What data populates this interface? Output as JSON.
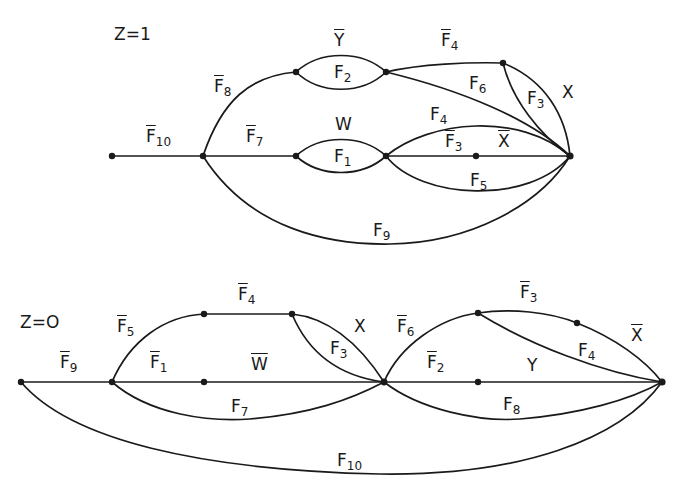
{
  "diagrams": [
    {
      "title": "Z=1",
      "labels": [
        {
          "id": "f10",
          "base": "F",
          "sub": "10",
          "bar": true,
          "x": 146,
          "y": 128
        },
        {
          "id": "f8",
          "base": "F",
          "sub": "8",
          "bar": true,
          "x": 214,
          "y": 78
        },
        {
          "id": "f7",
          "base": "F",
          "sub": "7",
          "bar": true,
          "x": 246,
          "y": 128
        },
        {
          "id": "ybar",
          "base": "Y",
          "sub": "",
          "bar": true,
          "x": 334,
          "y": 32
        },
        {
          "id": "f2",
          "base": "F",
          "sub": "2",
          "bar": false,
          "x": 334,
          "y": 64
        },
        {
          "id": "w",
          "base": "W",
          "sub": "",
          "bar": false,
          "x": 335,
          "y": 116
        },
        {
          "id": "f1",
          "base": "F",
          "sub": "1",
          "bar": false,
          "x": 334,
          "y": 148
        },
        {
          "id": "f4bar",
          "base": "F",
          "sub": "4",
          "bar": true,
          "x": 441,
          "y": 32
        },
        {
          "id": "f6",
          "base": "F",
          "sub": "6",
          "bar": false,
          "x": 469,
          "y": 75
        },
        {
          "id": "f3",
          "base": "F",
          "sub": "3",
          "bar": false,
          "x": 527,
          "y": 90
        },
        {
          "id": "x",
          "base": "X",
          "sub": "",
          "bar": false,
          "x": 562,
          "y": 84
        },
        {
          "id": "f4",
          "base": "F",
          "sub": "4",
          "bar": false,
          "x": 430,
          "y": 106
        },
        {
          "id": "f3bar",
          "base": "F",
          "sub": "3",
          "bar": true,
          "x": 445,
          "y": 133
        },
        {
          "id": "xbar",
          "base": "X",
          "sub": "",
          "bar": true,
          "x": 498,
          "y": 133
        },
        {
          "id": "f5",
          "base": "F",
          "sub": "5",
          "bar": false,
          "x": 470,
          "y": 172
        },
        {
          "id": "f9",
          "base": "F",
          "sub": "9",
          "bar": false,
          "x": 373,
          "y": 222
        }
      ]
    },
    {
      "title": "Z=O",
      "labels": [
        {
          "id": "f9bar",
          "base": "F",
          "sub": "9",
          "bar": true,
          "x": 60,
          "y": 354
        },
        {
          "id": "f5bar",
          "base": "F",
          "sub": "5",
          "bar": true,
          "x": 117,
          "y": 318
        },
        {
          "id": "f1bar",
          "base": "F",
          "sub": "1",
          "bar": true,
          "x": 150,
          "y": 354
        },
        {
          "id": "f4bar",
          "base": "F",
          "sub": "4",
          "bar": true,
          "x": 238,
          "y": 286
        },
        {
          "id": "wbar",
          "base": "W",
          "sub": "",
          "bar": true,
          "x": 251,
          "y": 356
        },
        {
          "id": "x",
          "base": "X",
          "sub": "",
          "bar": false,
          "x": 354,
          "y": 318
        },
        {
          "id": "f3",
          "base": "F",
          "sub": "3",
          "bar": false,
          "x": 330,
          "y": 340
        },
        {
          "id": "f7",
          "base": "F",
          "sub": "7",
          "bar": false,
          "x": 231,
          "y": 398
        },
        {
          "id": "f6bar",
          "base": "F",
          "sub": "6",
          "bar": true,
          "x": 397,
          "y": 318
        },
        {
          "id": "f2bar",
          "base": "F",
          "sub": "2",
          "bar": true,
          "x": 427,
          "y": 354
        },
        {
          "id": "f3bar",
          "base": "F",
          "sub": "3",
          "bar": true,
          "x": 520,
          "y": 284
        },
        {
          "id": "xbar",
          "base": "X",
          "sub": "",
          "bar": true,
          "x": 631,
          "y": 327
        },
        {
          "id": "f4",
          "base": "F",
          "sub": "4",
          "bar": false,
          "x": 578,
          "y": 342
        },
        {
          "id": "y",
          "base": "Y",
          "sub": "",
          "bar": false,
          "x": 527,
          "y": 357
        },
        {
          "id": "f8",
          "base": "F",
          "sub": "8",
          "bar": false,
          "x": 503,
          "y": 396
        },
        {
          "id": "f10",
          "base": "F",
          "sub": "10",
          "bar": false,
          "x": 337,
          "y": 452
        }
      ]
    }
  ]
}
